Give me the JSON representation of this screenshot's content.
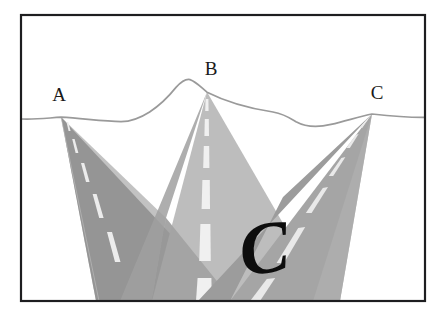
{
  "figure": {
    "background_color": "#ffffff",
    "frame": {
      "name": "outer-frame",
      "color": "#1e1e20",
      "stroke_width": 2,
      "x": 20,
      "y": 14,
      "width": 406,
      "height": 288
    },
    "horizon": {
      "name": "horizon-line",
      "color": "#9a9a9a",
      "stroke_width": 1.6
    },
    "labels": [
      {
        "id": "A",
        "text": "A",
        "x": 59,
        "y": 101
      },
      {
        "id": "B",
        "text": "B",
        "x": 211,
        "y": 75
      },
      {
        "id": "C",
        "text": "C",
        "x": 377,
        "y": 99
      }
    ],
    "annotation": {
      "name": "handwritten-c",
      "text": "C",
      "x": 243,
      "y": 276,
      "rotation": -8,
      "color": "#0d0d0d"
    },
    "roads": [
      {
        "id": "road-a",
        "label": "A",
        "fill": "#9b9b9b",
        "fill_shadow": "#8a8a8a",
        "vanishing_point": {
          "x": 61,
          "y": 117
        },
        "dash_color": "#e6e6e6"
      },
      {
        "id": "road-b",
        "label": "B",
        "fill": "#bdbdbd",
        "fill_shadow": "#ababab",
        "vanishing_point": {
          "x": 207,
          "y": 92
        },
        "dash_color": "#ededed"
      },
      {
        "id": "road-c",
        "label": "C",
        "fill": "#a5a5a5",
        "fill_shadow": "#969696",
        "vanishing_point": {
          "x": 372,
          "y": 114
        },
        "dash_color": "#e6e6e6"
      }
    ],
    "colors": {
      "frame": "#1e1e20",
      "horizon": "#9a9a9a",
      "road_light": "#bdbdbd",
      "road_mid": "#a5a5a5",
      "road_dark": "#9b9b9b",
      "dash": "#ededed",
      "ink": "#0d0d0d",
      "paper": "#ffffff"
    }
  }
}
